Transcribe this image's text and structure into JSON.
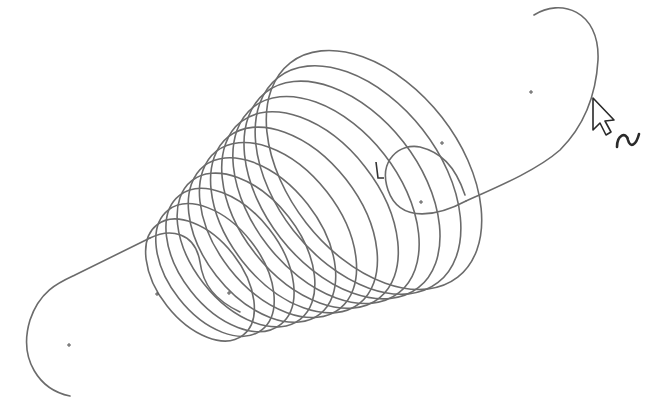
{
  "view": {
    "type": "cad-sketch-viewport",
    "background": "#ffffff",
    "curve_color": "#6b6b6b",
    "cursor_color": "#2a2a2a"
  },
  "sketch": {
    "entity": "helical-spring-with-hooks",
    "coil_count": 12,
    "coils": [
      {
        "cx": 200,
        "cy": 280,
        "rx": 42,
        "ry": 70
      },
      {
        "cx": 215,
        "cy": 270,
        "rx": 46,
        "ry": 76
      },
      {
        "cx": 230,
        "cy": 260,
        "rx": 50,
        "ry": 82
      },
      {
        "cx": 246,
        "cy": 250,
        "rx": 54,
        "ry": 88
      },
      {
        "cx": 262,
        "cy": 240,
        "rx": 58,
        "ry": 94
      },
      {
        "cx": 278,
        "cy": 230,
        "rx": 62,
        "ry": 100
      },
      {
        "cx": 294,
        "cy": 220,
        "rx": 66,
        "ry": 106
      },
      {
        "cx": 310,
        "cy": 210,
        "rx": 70,
        "ry": 112
      },
      {
        "cx": 326,
        "cy": 200,
        "rx": 74,
        "ry": 118
      },
      {
        "cx": 342,
        "cy": 190,
        "rx": 78,
        "ry": 124
      },
      {
        "cx": 358,
        "cy": 180,
        "rx": 82,
        "ry": 130
      },
      {
        "cx": 374,
        "cy": 170,
        "rx": 86,
        "ry": 136
      }
    ],
    "points": [
      {
        "x": 69,
        "y": 345
      },
      {
        "x": 157,
        "y": 294
      },
      {
        "x": 229,
        "y": 293
      },
      {
        "x": 421,
        "y": 202
      },
      {
        "x": 442,
        "y": 143
      },
      {
        "x": 531,
        "y": 92
      }
    ]
  },
  "cursor": {
    "icon": "arrow-pointer-icon",
    "badge": "spline-tool-icon",
    "badge_glyph": "~",
    "x": 592,
    "y": 98
  }
}
